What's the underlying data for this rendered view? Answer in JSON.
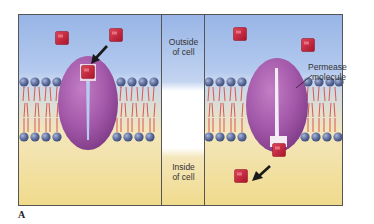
{
  "figure": {
    "label": "A"
  },
  "regions": {
    "outside": {
      "line1": "Outside",
      "line2": "of cell"
    },
    "inside": {
      "line1": "Inside",
      "line2": "of cell"
    }
  },
  "annotations": {
    "permease": {
      "line1": "Permease",
      "line2": "molecule"
    }
  },
  "panels": [
    {
      "id": "left",
      "state": "solute binding at outer face"
    },
    {
      "id": "right",
      "state": "solute released to cell interior"
    }
  ],
  "colors": {
    "outside_top": "#9db8e6",
    "outside_bottom": "#b8cdee",
    "inside_top": "#f3e3a8",
    "inside_bottom": "#f2de92",
    "frame": "#555555",
    "permease": "#a257a8",
    "permease_dark": "#7e3b86",
    "solute": "#c81e35",
    "head": "#5a6a9a",
    "tail": "#d9584f"
  }
}
